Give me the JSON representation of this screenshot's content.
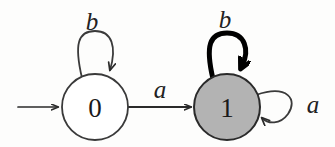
{
  "diagram": {
    "type": "finite-state-automaton",
    "background_color": "#fdfdfc",
    "stroke_color": "#2a2a2a",
    "accent_color": "#000000",
    "states": [
      {
        "id": "state-0",
        "label": "0",
        "fill": "#ffffff",
        "stroke": "#3a3a3a",
        "cx": 95,
        "cy": 107,
        "r": 33,
        "is_start": true,
        "is_accepting": false,
        "highlighted": false
      },
      {
        "id": "state-1",
        "label": "1",
        "fill": "#b3b3b3",
        "stroke": "#2a2a2a",
        "cx": 227,
        "cy": 107,
        "r": 33,
        "is_start": false,
        "is_accepting": false,
        "highlighted": true
      }
    ],
    "transitions": [
      {
        "id": "loop-0-b",
        "from": "state-0",
        "to": "state-0",
        "label": "b",
        "kind": "self-loop-top",
        "emphasis": "normal",
        "label_x": 92,
        "label_y": 21
      },
      {
        "id": "edge-0-1-a",
        "from": "state-0",
        "to": "state-1",
        "label": "a",
        "kind": "straight",
        "emphasis": "normal",
        "label_x": 160,
        "label_y": 89
      },
      {
        "id": "loop-1-b",
        "from": "state-1",
        "to": "state-1",
        "label": "b",
        "kind": "self-loop-top",
        "emphasis": "bold",
        "label_x": 225,
        "label_y": 19
      },
      {
        "id": "loop-1-a",
        "from": "state-1",
        "to": "state-1",
        "label": "a",
        "kind": "self-loop-right",
        "emphasis": "normal",
        "label_x": 313,
        "label_y": 104
      }
    ],
    "start_arrow": {
      "id": "start-arrow",
      "label": "",
      "x1": 18,
      "y1": 107,
      "x2": 60,
      "y2": 107
    }
  }
}
